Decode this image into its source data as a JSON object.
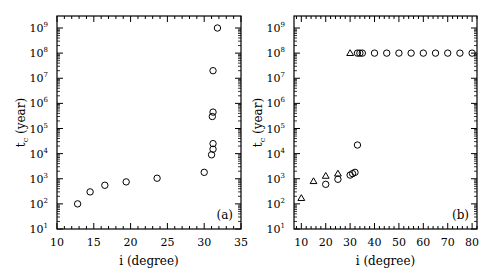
{
  "chart_data": [
    {
      "type": "scatter",
      "panel_label": "(a)",
      "xlabel": "i (degree)",
      "ylabel": "t_c (year)",
      "xlim": [
        10,
        35
      ],
      "ylim": [
        10,
        1000000000
      ],
      "yscale": "log",
      "xticks": [
        10,
        15,
        20,
        25,
        30,
        35
      ],
      "yticks_exp": [
        1,
        2,
        3,
        4,
        5,
        6,
        7,
        8,
        9
      ],
      "series": [
        {
          "name": "circles",
          "marker": "circle",
          "points": [
            [
              12.8,
              100
            ],
            [
              14.5,
              300
            ],
            [
              16.5,
              550
            ],
            [
              19.4,
              750
            ],
            [
              23.6,
              1050
            ],
            [
              30.0,
              1800
            ],
            [
              31.0,
              9000
            ],
            [
              31.2,
              15000
            ],
            [
              31.2,
              25000
            ],
            [
              31.1,
              300000
            ],
            [
              31.2,
              450000
            ],
            [
              31.2,
              20000000
            ],
            [
              31.8,
              1000000000
            ]
          ]
        }
      ]
    },
    {
      "type": "scatter",
      "panel_label": "(b)",
      "xlabel": "i (degree)",
      "ylabel": "t_c (year)",
      "xlim": [
        7,
        82
      ],
      "ylim": [
        10,
        1000000000
      ],
      "yscale": "log",
      "xticks": [
        10,
        20,
        30,
        40,
        50,
        60,
        70,
        80
      ],
      "yticks_exp": [
        1,
        2,
        3,
        4,
        5,
        6,
        7,
        8,
        9
      ],
      "series": [
        {
          "name": "triangles",
          "marker": "triangle",
          "points": [
            [
              10,
              170
            ],
            [
              15,
              800
            ],
            [
              20,
              1300
            ],
            [
              25,
              1600
            ],
            [
              30,
              100000000
            ]
          ]
        },
        {
          "name": "circles",
          "marker": "circle",
          "points": [
            [
              20,
              600
            ],
            [
              25,
              950
            ],
            [
              30,
              1400
            ],
            [
              31,
              1600
            ],
            [
              32,
              1800
            ],
            [
              33,
              22000
            ],
            [
              33,
              100000000
            ],
            [
              34,
              100000000
            ],
            [
              35,
              100000000
            ],
            [
              40,
              100000000
            ],
            [
              45,
              100000000
            ],
            [
              50,
              100000000
            ],
            [
              55,
              100000000
            ],
            [
              60,
              100000000
            ],
            [
              65,
              100000000
            ],
            [
              70,
              100000000
            ],
            [
              75,
              100000000
            ],
            [
              80,
              100000000
            ]
          ]
        }
      ]
    }
  ]
}
